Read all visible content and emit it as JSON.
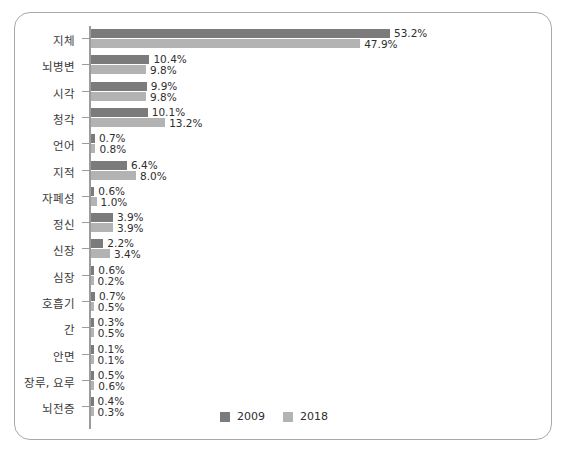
{
  "chart_data": {
    "type": "bar",
    "orientation": "horizontal",
    "title": "",
    "subtitle": "",
    "xlabel": "",
    "ylabel": "",
    "xlim": [
      0,
      55
    ],
    "grid": false,
    "legend_position": "bottom-center",
    "value_suffix": "%",
    "categories": [
      "지체",
      "뇌병변",
      "시각",
      "청각",
      "언어",
      "지적",
      "자폐성",
      "정신",
      "신장",
      "심장",
      "호흡기",
      "간",
      "안면",
      "장루, 요루",
      "뇌전증"
    ],
    "series": [
      {
        "name": "2009",
        "color": "#7b7b7b",
        "values": [
          53.2,
          10.4,
          9.9,
          10.1,
          0.7,
          6.4,
          0.6,
          3.9,
          2.2,
          0.6,
          0.7,
          0.3,
          0.1,
          0.5,
          0.4
        ],
        "labels": [
          "53.2%",
          "10.4%",
          "9.9%",
          "10.1%",
          "0.7%",
          "6.4%",
          "0.6%",
          "3.9%",
          "2.2%",
          "0.6%",
          "0.7%",
          "0.3%",
          "0.1%",
          "0.5%",
          "0.4%"
        ]
      },
      {
        "name": "2018",
        "color": "#b3b3b3",
        "values": [
          47.9,
          9.8,
          9.8,
          13.2,
          0.8,
          8.0,
          1.0,
          3.9,
          3.4,
          0.2,
          0.5,
          0.5,
          0.1,
          0.6,
          0.3
        ],
        "labels": [
          "47.9%",
          "9.8%",
          "9.8%",
          "13.2%",
          "0.8%",
          "8.0%",
          "1.0%",
          "3.9%",
          "3.4%",
          "0.2%",
          "0.5%",
          "0.5%",
          "0.1%",
          "0.6%",
          "0.3%"
        ]
      }
    ],
    "legend": [
      {
        "label": "2009",
        "color": "#7b7b7b"
      },
      {
        "label": "2018",
        "color": "#b3b3b3"
      }
    ]
  },
  "frame": {
    "border_color": "#a9a9a9",
    "background": "#ffffff"
  },
  "axis": {
    "line_color": "#9b9b9b"
  }
}
